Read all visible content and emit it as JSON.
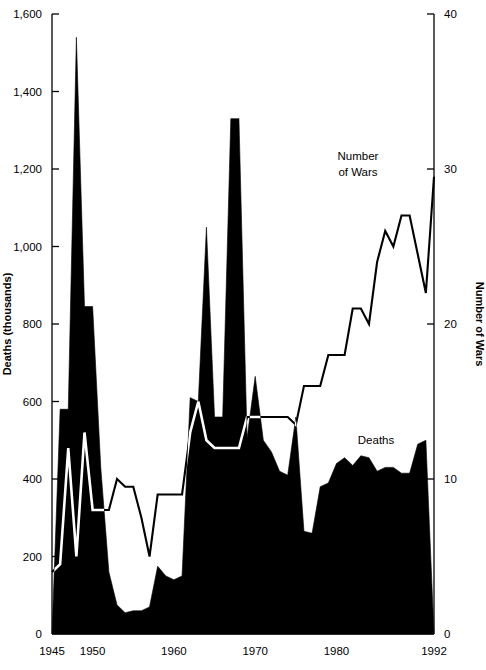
{
  "chart_data": {
    "type": "area",
    "title": "",
    "xlabel": "",
    "x_tick_labels": [
      "1945",
      "1950",
      "1960",
      "1970",
      "1980",
      "1992"
    ],
    "x_tick_values": [
      1945,
      1950,
      1960,
      1970,
      1980,
      1992
    ],
    "xlim": [
      1945,
      1992
    ],
    "grid": false,
    "legend_position": "inline-annotations",
    "axes": {
      "left": {
        "label": "Deaths (thousands)",
        "ylim": [
          0,
          1600
        ],
        "ticks": [
          0,
          200,
          400,
          600,
          800,
          1000,
          1200,
          1400,
          1600
        ],
        "tick_labels": [
          "0",
          "200",
          "400",
          "600",
          "800",
          "1,000",
          "1,200",
          "1,400",
          "1,600"
        ]
      },
      "right": {
        "label": "Number of Wars",
        "ylim": [
          0,
          40
        ],
        "ticks": [
          0,
          10,
          20,
          30,
          40
        ],
        "tick_labels": [
          "0",
          "10",
          "20",
          "30",
          "40"
        ]
      }
    },
    "annotations": [
      {
        "text": "Number of Wars",
        "x": 1978,
        "y": 31.5,
        "axis": "right"
      },
      {
        "text": "Deaths",
        "x": 1979,
        "y": 520,
        "axis": "left"
      }
    ],
    "x": [
      1945,
      1946,
      1947,
      1948,
      1949,
      1950,
      1951,
      1952,
      1953,
      1954,
      1955,
      1956,
      1957,
      1958,
      1959,
      1960,
      1961,
      1962,
      1963,
      1964,
      1965,
      1966,
      1967,
      1968,
      1969,
      1970,
      1971,
      1972,
      1973,
      1974,
      1975,
      1976,
      1977,
      1978,
      1979,
      1980,
      1981,
      1982,
      1983,
      1984,
      1985,
      1986,
      1987,
      1988,
      1989,
      1990,
      1991,
      1992
    ],
    "series": [
      {
        "name": "Deaths",
        "style": "filled-area",
        "color": "#000000",
        "axis": "left",
        "unit": "thousands",
        "values": [
          0,
          580,
          580,
          1540,
          845,
          845,
          430,
          160,
          75,
          55,
          60,
          60,
          70,
          175,
          150,
          140,
          150,
          610,
          600,
          1050,
          560,
          560,
          1330,
          1330,
          505,
          665,
          500,
          470,
          420,
          410,
          560,
          265,
          260,
          380,
          390,
          440,
          455,
          435,
          460,
          455,
          420,
          430,
          430,
          415,
          415,
          490,
          500,
          0
        ]
      },
      {
        "name": "Number of Wars",
        "style": "line",
        "color": "#000000",
        "axis": "right",
        "values": [
          4,
          4.5,
          12,
          5,
          13,
          8,
          8,
          8,
          10,
          9.5,
          9.5,
          7.5,
          5,
          9,
          9,
          9,
          9,
          13,
          15,
          12.5,
          12,
          12,
          12,
          12,
          14,
          14,
          14,
          14,
          14,
          14,
          13.5,
          16,
          16,
          16,
          18,
          18,
          18,
          21,
          21,
          20,
          24,
          26,
          25,
          27,
          27,
          24.5,
          22,
          29.5
        ]
      }
    ]
  },
  "labels": {
    "left_axis_title": "Deaths (thousands)",
    "right_axis_title": "Number of Wars",
    "wars_annotation_line1": "Number",
    "wars_annotation_line2": "of Wars",
    "deaths_annotation": "Deaths"
  }
}
